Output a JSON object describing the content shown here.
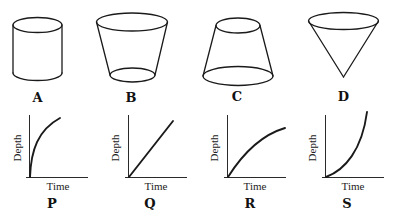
{
  "shapes": [
    {
      "id": "A",
      "label": "A",
      "type": "cylinder"
    },
    {
      "id": "B",
      "label": "B",
      "type": "truncated-cone-wide-top"
    },
    {
      "id": "C",
      "label": "C",
      "type": "truncated-cone-wide-bottom"
    },
    {
      "id": "D",
      "label": "D",
      "type": "inverted-cone"
    }
  ],
  "graphs": [
    {
      "id": "P",
      "label": "P",
      "xlabel": "Time",
      "ylabel": "Depth",
      "shape": "concave-steep-then-flatten"
    },
    {
      "id": "Q",
      "label": "Q",
      "xlabel": "Time",
      "ylabel": "Depth",
      "shape": "linear"
    },
    {
      "id": "R",
      "label": "R",
      "xlabel": "Time",
      "ylabel": "Depth",
      "shape": "concave-gradual"
    },
    {
      "id": "S",
      "label": "S",
      "xlabel": "Time",
      "ylabel": "Depth",
      "shape": "convex-accelerating"
    }
  ]
}
